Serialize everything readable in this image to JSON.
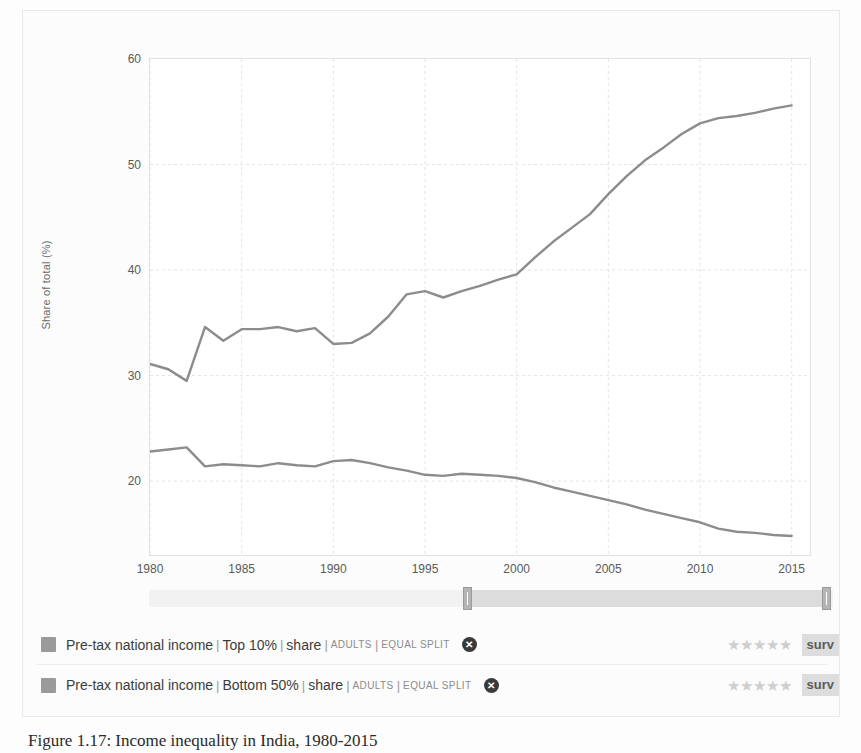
{
  "caption": "Figure 1.17: Income inequality in India, 1980-2015",
  "chart_data": {
    "type": "line",
    "title": "",
    "xlabel": "",
    "ylabel": "Share of total (%)",
    "xlim": [
      1980,
      2016
    ],
    "ylim": [
      13,
      60
    ],
    "xticks": [
      1980,
      1985,
      1990,
      1995,
      2000,
      2005,
      2010,
      2015
    ],
    "yticks": [
      20,
      30,
      40,
      50,
      60
    ],
    "grid": true,
    "legend_position": "bottom",
    "x": [
      1980,
      1981,
      1982,
      1983,
      1984,
      1985,
      1986,
      1987,
      1988,
      1989,
      1990,
      1991,
      1992,
      1993,
      1994,
      1995,
      1996,
      1997,
      1998,
      1999,
      2000,
      2001,
      2002,
      2003,
      2004,
      2005,
      2006,
      2007,
      2008,
      2009,
      2010,
      2011,
      2012,
      2013,
      2014,
      2015
    ],
    "series": [
      {
        "name": "Pre-tax national income | Top 10% | share",
        "color": "#8c8c8c",
        "values": [
          31.1,
          30.6,
          29.5,
          34.6,
          33.3,
          34.4,
          34.4,
          34.6,
          34.2,
          34.5,
          33.0,
          33.1,
          34.0,
          35.6,
          37.7,
          38.0,
          37.4,
          38.0,
          38.5,
          39.1,
          39.6,
          41.2,
          42.7,
          44.0,
          45.3,
          47.2,
          48.9,
          50.4,
          51.6,
          52.9,
          53.9,
          54.4,
          54.6,
          54.9,
          55.3,
          55.6
        ]
      },
      {
        "name": "Pre-tax national income | Bottom 50% | share",
        "color": "#8c8c8c",
        "values": [
          22.8,
          23.0,
          23.2,
          21.4,
          21.6,
          21.5,
          21.4,
          21.7,
          21.5,
          21.4,
          21.9,
          22.0,
          21.7,
          21.3,
          21.0,
          20.6,
          20.5,
          20.7,
          20.6,
          20.5,
          20.3,
          19.9,
          19.4,
          19.0,
          18.6,
          18.2,
          17.8,
          17.3,
          16.9,
          16.5,
          16.1,
          15.5,
          15.2,
          15.1,
          14.9,
          14.8
        ]
      }
    ]
  },
  "slider": {
    "name": "year-range-slider",
    "left_handle_pct": 46.5,
    "right_handle_pct": 99.0
  },
  "legend": {
    "rows": [
      {
        "swatch_color": "#9a9a9a",
        "name": "Pre-tax national income",
        "sub": "Top 10%",
        "measure": "share",
        "population": "ADULTS",
        "split": "EQUAL SPLIT",
        "close_label": "✕",
        "stars": "★★★★★",
        "badge": "surv"
      },
      {
        "swatch_color": "#9a9a9a",
        "name": "Pre-tax national income",
        "sub": "Bottom 50%",
        "measure": "share",
        "population": "ADULTS",
        "split": "EQUAL SPLIT",
        "close_label": "✕",
        "stars": "★★★★★",
        "badge": "surv"
      }
    ],
    "separator": "|"
  }
}
